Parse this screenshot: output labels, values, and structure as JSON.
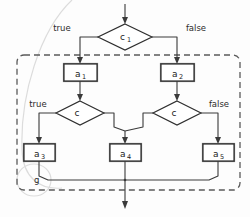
{
  "diagram": {
    "group": {
      "label": "g",
      "style": "dashed"
    },
    "decisions": [
      {
        "id": "c1",
        "base": "c",
        "subscript": "1",
        "true_label": "true",
        "false_label": "false"
      },
      {
        "id": "c-left",
        "base": "c",
        "subscript": "",
        "true_label": "true",
        "false_label": ""
      },
      {
        "id": "c-right",
        "base": "c",
        "subscript": "",
        "true_label": "",
        "false_label": "false"
      }
    ],
    "actions": [
      {
        "id": "a1",
        "base": "a",
        "subscript": "1"
      },
      {
        "id": "a2",
        "base": "a",
        "subscript": "2"
      },
      {
        "id": "a3",
        "base": "a",
        "subscript": "3"
      },
      {
        "id": "a4",
        "base": "a",
        "subscript": "4"
      },
      {
        "id": "a5",
        "base": "a",
        "subscript": "5"
      }
    ],
    "edge_labels": {
      "top_true": "true",
      "top_false": "false",
      "mid_true": "true",
      "mid_false": "false"
    },
    "colors": {
      "line": "#3a3a3a",
      "node_stroke": "#2e2e2e",
      "node_fill": "#ffffff",
      "group_stroke": "#5a5a5a",
      "text": "#1a1a1a",
      "background": "#fdfdfd",
      "artifact": "#dcdcdc"
    }
  }
}
